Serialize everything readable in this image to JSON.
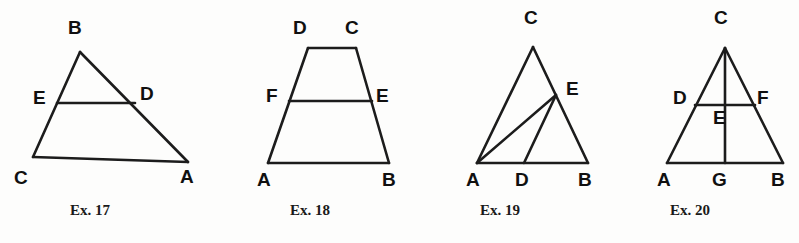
{
  "page": {
    "background_color": "#fdfdfc",
    "ink_color": "#1c1c1c"
  },
  "figures": [
    {
      "id": "ex17",
      "caption": "Ex. 17",
      "shape": "triangle with midsegment",
      "labels": [
        {
          "text": "B",
          "x": 68,
          "y": 18
        },
        {
          "text": "E",
          "x": 33,
          "y": 88
        },
        {
          "text": "D",
          "x": 140,
          "y": 84
        },
        {
          "text": "C",
          "x": 14,
          "y": 168
        },
        {
          "text": "A",
          "x": 180,
          "y": 167
        }
      ],
      "caption_x": 70,
      "caption_y": 203
    },
    {
      "id": "ex18",
      "caption": "Ex. 18",
      "shape": "trapezoid with midsegment",
      "labels": [
        {
          "text": "D",
          "x": 293,
          "y": 18
        },
        {
          "text": "C",
          "x": 345,
          "y": 18
        },
        {
          "text": "F",
          "x": 266,
          "y": 86
        },
        {
          "text": "E",
          "x": 376,
          "y": 86
        },
        {
          "text": "A",
          "x": 257,
          "y": 170
        },
        {
          "text": "B",
          "x": 382,
          "y": 170
        }
      ],
      "caption_x": 290,
      "caption_y": 203
    },
    {
      "id": "ex19",
      "caption": "Ex. 19",
      "shape": "triangle with cevians AE and DE",
      "labels": [
        {
          "text": "C",
          "x": 524,
          "y": 8
        },
        {
          "text": "E",
          "x": 566,
          "y": 79
        },
        {
          "text": "A",
          "x": 466,
          "y": 170
        },
        {
          "text": "D",
          "x": 515,
          "y": 170
        },
        {
          "text": "B",
          "x": 578,
          "y": 170
        }
      ],
      "caption_x": 480,
      "caption_y": 203
    },
    {
      "id": "ex20",
      "caption": "Ex. 20",
      "shape": "triangle with altitude CG and segment DF",
      "labels": [
        {
          "text": "C",
          "x": 714,
          "y": 8
        },
        {
          "text": "D",
          "x": 673,
          "y": 88
        },
        {
          "text": "F",
          "x": 757,
          "y": 88
        },
        {
          "text": "E",
          "x": 713,
          "y": 108
        },
        {
          "text": "A",
          "x": 657,
          "y": 170
        },
        {
          "text": "G",
          "x": 712,
          "y": 170
        },
        {
          "text": "B",
          "x": 771,
          "y": 170
        }
      ],
      "caption_x": 670,
      "caption_y": 203
    }
  ],
  "geometry": {
    "ex17": {
      "points": {
        "B": [
          80,
          52
        ],
        "C": [
          33,
          157
        ],
        "A": [
          188,
          162
        ],
        "E": [
          57,
          103
        ],
        "D": [
          135,
          103
        ]
      },
      "segments": [
        [
          "B",
          "C"
        ],
        [
          "B",
          "A"
        ],
        [
          "C",
          "A"
        ],
        [
          "E",
          "D"
        ]
      ]
    },
    "ex18": {
      "points": {
        "D": [
          308,
          48
        ],
        "C": [
          356,
          48
        ],
        "A": [
          268,
          163
        ],
        "B": [
          389,
          163
        ],
        "F": [
          289,
          101
        ],
        "E": [
          372,
          101
        ]
      },
      "segments": [
        [
          "D",
          "C"
        ],
        [
          "D",
          "A"
        ],
        [
          "C",
          "B"
        ],
        [
          "A",
          "B"
        ],
        [
          "F",
          "E"
        ]
      ]
    },
    "ex19": {
      "points": {
        "C": [
          533,
          47
        ],
        "A": [
          477,
          163
        ],
        "B": [
          588,
          163
        ],
        "E": [
          556,
          95
        ],
        "D": [
          524,
          163
        ]
      },
      "segments": [
        [
          "C",
          "A"
        ],
        [
          "C",
          "B"
        ],
        [
          "A",
          "B"
        ],
        [
          "A",
          "E"
        ],
        [
          "D",
          "E"
        ]
      ]
    },
    "ex20": {
      "points": {
        "C": [
          725,
          48
        ],
        "A": [
          667,
          163
        ],
        "B": [
          783,
          163
        ],
        "G": [
          725,
          163
        ],
        "D": [
          695,
          105
        ],
        "F": [
          755,
          105
        ]
      },
      "segments": [
        [
          "C",
          "A"
        ],
        [
          "C",
          "B"
        ],
        [
          "A",
          "B"
        ],
        [
          "C",
          "G"
        ],
        [
          "D",
          "F"
        ]
      ]
    }
  }
}
